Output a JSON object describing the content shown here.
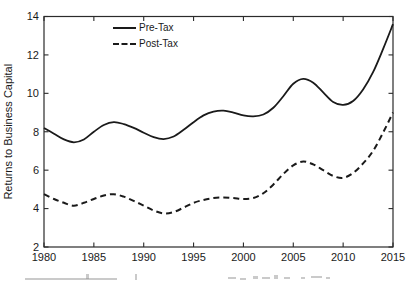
{
  "figure": {
    "background": "#ffffff",
    "axis_color": "#2b2b2b",
    "text_color": "#1a1a1a"
  },
  "legend": {
    "items": [
      {
        "label": "Pre-Tax",
        "style": "solid"
      },
      {
        "label": "Post-Tax",
        "style": "dashed"
      }
    ]
  },
  "chart_data": {
    "type": "line",
    "title": "",
    "xlabel": "",
    "ylabel": "Returns to Business Capital",
    "xlim": [
      1980,
      2015
    ],
    "ylim": [
      2,
      14
    ],
    "xticks": [
      1980,
      1985,
      1990,
      1995,
      2000,
      2005,
      2010,
      2015
    ],
    "yticks": [
      2,
      4,
      6,
      8,
      10,
      12,
      14
    ],
    "grid": false,
    "box": true,
    "legend_position": "top-left-inside",
    "line_color": "#1a1a1a",
    "x": [
      1980,
      1981,
      1982,
      1983,
      1984,
      1985,
      1986,
      1987,
      1988,
      1989,
      1990,
      1991,
      1992,
      1993,
      1994,
      1995,
      1996,
      1997,
      1998,
      1999,
      2000,
      2001,
      2002,
      2003,
      2004,
      2005,
      2006,
      2007,
      2008,
      2009,
      2010,
      2011,
      2012,
      2013,
      2014,
      2015
    ],
    "series": [
      {
        "name": "Pre-Tax",
        "style": "solid",
        "values": [
          8.2,
          7.9,
          7.6,
          7.45,
          7.6,
          8.0,
          8.35,
          8.5,
          8.4,
          8.2,
          7.95,
          7.72,
          7.62,
          7.75,
          8.1,
          8.5,
          8.85,
          9.05,
          9.1,
          9.0,
          8.85,
          8.8,
          8.9,
          9.25,
          9.85,
          10.5,
          10.75,
          10.55,
          10.05,
          9.55,
          9.4,
          9.6,
          10.2,
          11.1,
          12.3,
          13.6
        ]
      },
      {
        "name": "Post-Tax",
        "style": "dashed",
        "values": [
          4.75,
          4.5,
          4.3,
          4.15,
          4.3,
          4.5,
          4.68,
          4.75,
          4.62,
          4.4,
          4.15,
          3.9,
          3.75,
          3.82,
          4.05,
          4.3,
          4.45,
          4.55,
          4.58,
          4.55,
          4.5,
          4.55,
          4.8,
          5.25,
          5.8,
          6.25,
          6.45,
          6.3,
          6.0,
          5.7,
          5.6,
          5.85,
          6.35,
          7.0,
          7.95,
          9.0
        ]
      }
    ]
  }
}
